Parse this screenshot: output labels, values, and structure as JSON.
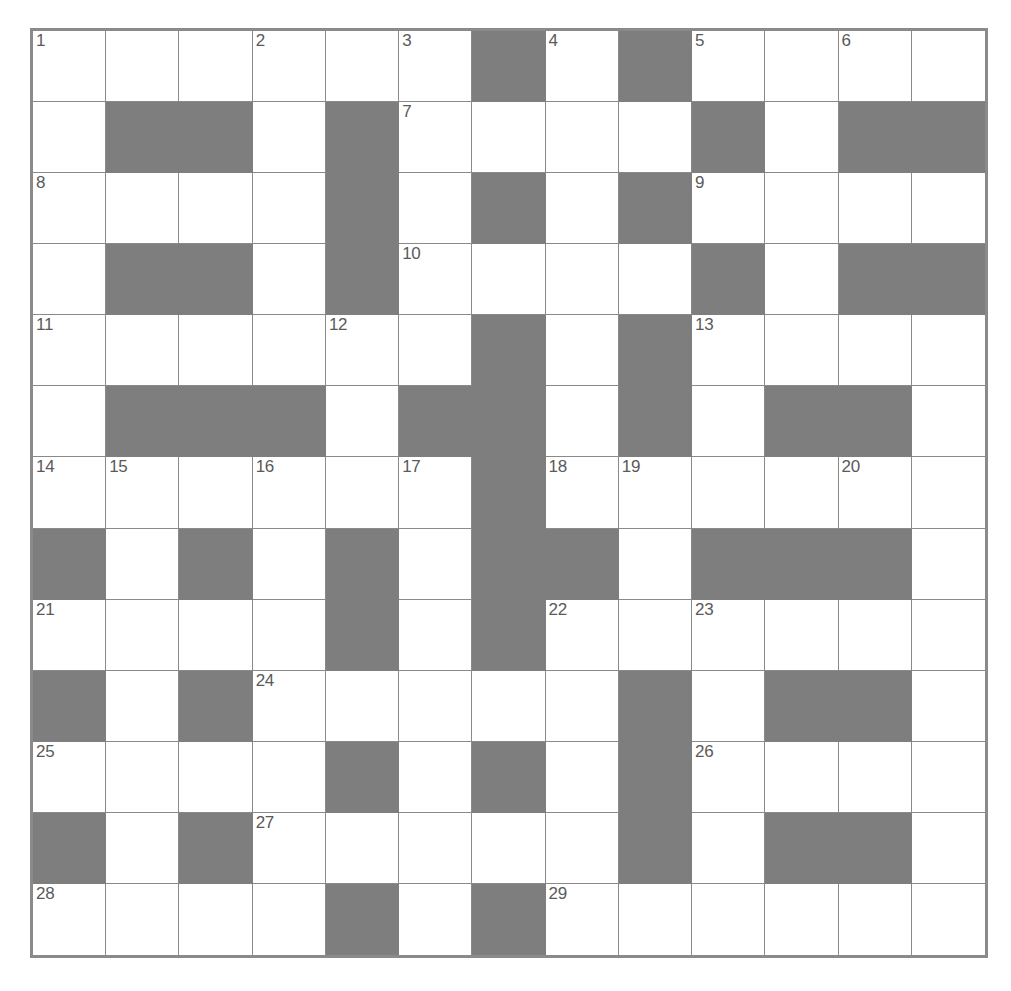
{
  "puzzle": {
    "kind": "crossword-grid",
    "title": "",
    "columns": 13,
    "rows": 13,
    "cell_size_px": 74,
    "colors": {
      "background": "#ffffff",
      "grid_line": "#8a8a8a",
      "block_fill": "#7e7e7e",
      "number_text": "#5a5a5a"
    },
    "highest_clue_number": 29,
    "clue_numbers_present": [
      1,
      2,
      3,
      4,
      5,
      6,
      7,
      8,
      9,
      10,
      11,
      12,
      13,
      14,
      15,
      16,
      17,
      18,
      19,
      20,
      21,
      22,
      23,
      24,
      25,
      26,
      27,
      28,
      29
    ],
    "grid": [
      [
        "1",
        "",
        "",
        "2",
        "",
        "3",
        "#",
        "4",
        "#",
        "5",
        "",
        "6",
        ""
      ],
      [
        "",
        "#",
        "#",
        "",
        "#",
        "7",
        "",
        "",
        "",
        "#",
        "",
        "#",
        "#"
      ],
      [
        "8",
        "",
        "",
        "",
        "#",
        "",
        "#",
        "",
        "#",
        "9",
        "",
        "",
        ""
      ],
      [
        "",
        "#",
        "#",
        "",
        "#",
        "10",
        "",
        "",
        "",
        "#",
        "",
        "#",
        "#"
      ],
      [
        "11",
        "",
        "",
        "",
        "12",
        "",
        "#",
        "",
        "#",
        "13",
        "",
        "",
        ""
      ],
      [
        "",
        "#",
        "#",
        "#",
        "",
        "#",
        "#",
        "",
        "#",
        "",
        "#",
        "#",
        ""
      ],
      [
        "14",
        "15",
        "",
        "16",
        "",
        "17",
        "#",
        "18",
        "19",
        "",
        "",
        "20",
        ""
      ],
      [
        "#",
        "",
        "#",
        "",
        "#",
        "",
        "#",
        "#",
        "",
        "#",
        "#",
        "#",
        ""
      ],
      [
        "21",
        "",
        "",
        "",
        "#",
        "",
        "#",
        "22",
        "",
        "23",
        "",
        "",
        ""
      ],
      [
        "#",
        "",
        "#",
        "24",
        "",
        "",
        "",
        "",
        "#",
        "",
        "#",
        "#",
        ""
      ],
      [
        "25",
        "",
        "",
        "",
        "#",
        "",
        "#",
        "",
        "#",
        "26",
        "",
        "",
        ""
      ],
      [
        "#",
        "",
        "#",
        "27",
        "",
        "",
        "",
        "",
        "#",
        "",
        "#",
        "#",
        ""
      ],
      [
        "28",
        "",
        "",
        "",
        "#",
        "",
        "#",
        "29",
        "",
        "",
        "",
        "",
        ""
      ]
    ]
  }
}
